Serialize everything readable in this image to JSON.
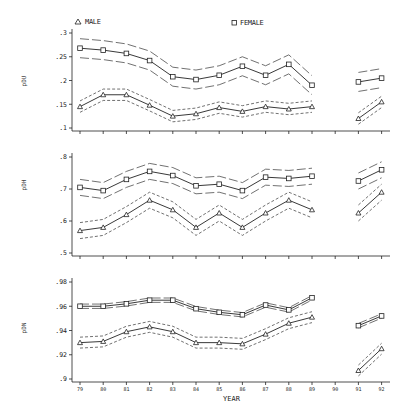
{
  "chart_data": [
    {
      "type": "line",
      "ylabel": "pDU",
      "xlabel": "",
      "categories": [
        "79",
        "80",
        "81",
        "82",
        "83",
        "84",
        "85",
        "86",
        "87",
        "88",
        "89",
        "90",
        "91",
        "92"
      ],
      "ylim": [
        0.1,
        0.3
      ],
      "yticks": [
        ".3",
        ".25",
        ".2",
        ".15",
        ".1"
      ],
      "ytick_values": [
        0.3,
        0.25,
        0.2,
        0.15,
        0.1
      ],
      "grid": false,
      "series": [
        {
          "name": "FEMALE",
          "marker": "square",
          "band_style": "long-dash",
          "band_halfwidth": 0.02,
          "values": [
            0.268,
            0.264,
            0.257,
            0.242,
            0.208,
            0.202,
            0.211,
            0.23,
            0.211,
            0.234,
            0.19,
            null,
            0.197,
            0.205
          ]
        },
        {
          "name": "MALE",
          "marker": "triangle",
          "band_style": "short-dash",
          "band_halfwidth": 0.012,
          "values": [
            0.145,
            0.17,
            0.17,
            0.148,
            0.125,
            0.13,
            0.143,
            0.135,
            0.145,
            0.14,
            0.145,
            null,
            0.12,
            0.155
          ]
        }
      ]
    },
    {
      "type": "line",
      "ylabel": "pDH",
      "xlabel": "",
      "categories": [
        "79",
        "80",
        "81",
        "82",
        "83",
        "84",
        "85",
        "86",
        "87",
        "88",
        "89",
        "90",
        "91",
        "92"
      ],
      "ylim": [
        0.5,
        0.8
      ],
      "yticks": [
        ".8",
        ".7",
        ".6",
        ".5"
      ],
      "ytick_values": [
        0.8,
        0.7,
        0.6,
        0.5
      ],
      "grid": false,
      "series": [
        {
          "name": "FEMALE",
          "marker": "square",
          "band_style": "long-dash",
          "band_halfwidth": 0.025,
          "values": [
            0.705,
            0.695,
            0.73,
            0.755,
            0.742,
            0.71,
            0.715,
            0.695,
            0.737,
            0.733,
            0.74,
            null,
            0.725,
            0.76
          ]
        },
        {
          "name": "MALE",
          "marker": "triangle",
          "band_style": "short-dash",
          "band_halfwidth": 0.025,
          "values": [
            0.57,
            0.58,
            0.62,
            0.665,
            0.635,
            0.58,
            0.625,
            0.58,
            0.625,
            0.665,
            0.635,
            null,
            0.625,
            0.69
          ]
        }
      ]
    },
    {
      "type": "line",
      "ylabel": "pDN",
      "xlabel": "YEAR",
      "categories": [
        "79",
        "80",
        "81",
        "82",
        "83",
        "84",
        "85",
        "86",
        "87",
        "88",
        "89",
        "90",
        "91",
        "92"
      ],
      "ylim": [
        0.9,
        0.98
      ],
      "yticks": [
        ".98",
        ".96",
        ".94",
        ".92",
        ".9"
      ],
      "ytick_values": [
        0.98,
        0.96,
        0.94,
        0.92,
        0.9
      ],
      "grid": false,
      "series": [
        {
          "name": "FEMALE",
          "marker": "square",
          "band_style": "long-dash",
          "band_halfwidth": 0.0018,
          "values": [
            0.96,
            0.96,
            0.962,
            0.965,
            0.965,
            0.958,
            0.955,
            0.953,
            0.961,
            0.957,
            0.967,
            null,
            0.944,
            0.952
          ]
        },
        {
          "name": "MALE",
          "marker": "triangle",
          "band_style": "short-dash",
          "band_halfwidth": 0.0045,
          "values": [
            0.93,
            0.931,
            0.939,
            0.943,
            0.939,
            0.93,
            0.93,
            0.929,
            0.937,
            0.946,
            0.951,
            null,
            0.907,
            0.925
          ]
        }
      ]
    }
  ],
  "legend": {
    "male_label": "MALE",
    "female_label": "FEMALE",
    "male_marker": "triangle-icon",
    "female_marker": "square-icon",
    "position": "top"
  },
  "xaxis": {
    "label": "YEAR",
    "ticks": [
      "79",
      "80",
      "81",
      "82",
      "83",
      "84",
      "85",
      "86",
      "87",
      "88",
      "89",
      "90",
      "91",
      "92"
    ]
  },
  "colors": {
    "line": "#222222",
    "band": "#333333",
    "background": "#ffffff"
  }
}
